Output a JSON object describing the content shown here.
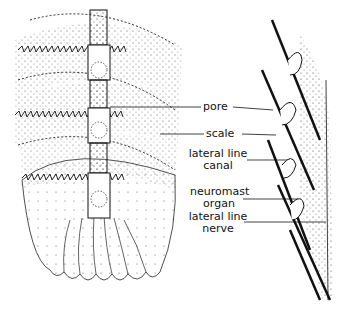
{
  "diagram": {
    "labels": {
      "pore": "pore",
      "scale": "scale",
      "lateral_line_canal_1": "lateral line",
      "lateral_line_canal_2": "canal",
      "neuromast_organ_1": "neuromast",
      "neuromast_organ_2": "organ",
      "lateral_line_nerve_1": "lateral line",
      "lateral_line_nerve_2": "nerve"
    },
    "colors": {
      "ink": "#111111",
      "background": "#ffffff"
    }
  }
}
